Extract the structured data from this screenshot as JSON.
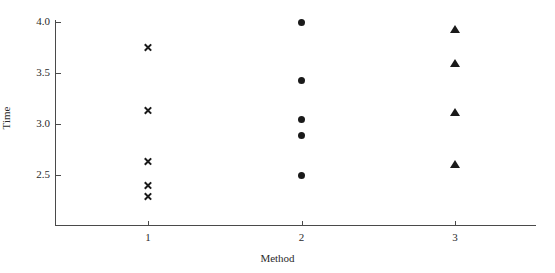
{
  "chart_data": {
    "type": "scatter",
    "title": "",
    "xlabel": "Method",
    "ylabel": "Time",
    "xlim": [
      0.55,
      3.6
    ],
    "ylim": [
      2.2,
      4.05
    ],
    "grid": false,
    "legend": "none",
    "x_ticks": [
      {
        "value": 1,
        "label": "1"
      },
      {
        "value": 2,
        "label": "2"
      },
      {
        "value": 3,
        "label": "3"
      }
    ],
    "y_ticks": [
      {
        "value": 4.0,
        "label": "4.0"
      },
      {
        "value": 3.5,
        "label": "3.5"
      },
      {
        "value": 3.0,
        "label": "3.0"
      },
      {
        "value": 2.5,
        "label": "2.5"
      }
    ],
    "series": [
      {
        "name": "Method 1",
        "marker": "cross",
        "color": "#1a1a1a",
        "x": [
          1,
          1,
          1,
          1,
          1
        ],
        "values": [
          3.75,
          3.13,
          2.63,
          2.4,
          2.29
        ]
      },
      {
        "name": "Method 2",
        "marker": "circle",
        "color": "#1a1a1a",
        "x": [
          2,
          2,
          2,
          2,
          2
        ],
        "values": [
          4.0,
          3.43,
          3.04,
          2.89,
          2.5
        ]
      },
      {
        "name": "Method 3",
        "marker": "triangle",
        "color": "#1a1a1a",
        "x": [
          3,
          3,
          3,
          3
        ],
        "values": [
          3.93,
          3.6,
          3.12,
          2.61
        ]
      }
    ]
  },
  "axes": {
    "x_title": "Method",
    "y_title": "Time"
  }
}
